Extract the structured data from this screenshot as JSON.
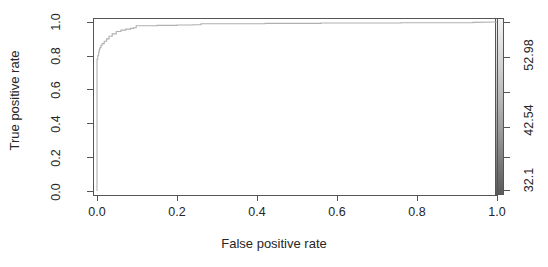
{
  "chart_data": {
    "type": "line",
    "title": "",
    "xlabel": "False positive rate",
    "ylabel": "True positive rate",
    "xlim": [
      0.0,
      1.0
    ],
    "ylim": [
      0.0,
      1.0
    ],
    "grid": false,
    "legend": "none",
    "xticks": [
      "0.0",
      "0.2",
      "0.4",
      "0.6",
      "0.8",
      "1.0"
    ],
    "xtick_values": [
      0.0,
      0.2,
      0.4,
      0.6,
      0.8,
      1.0
    ],
    "yticks": [
      "0.0",
      "0.2",
      "0.4",
      "0.6",
      "0.8",
      "1.0"
    ],
    "ytick_values": [
      0.0,
      0.2,
      0.4,
      0.6,
      0.8,
      1.0
    ],
    "series": [
      {
        "name": "ROC curve",
        "color": "#b0b0b0",
        "x": [
          0.0,
          0.0,
          0.002,
          0.002,
          0.004,
          0.004,
          0.005,
          0.005,
          0.006,
          0.006,
          0.008,
          0.008,
          0.01,
          0.01,
          0.013,
          0.013,
          0.018,
          0.018,
          0.024,
          0.024,
          0.03,
          0.03,
          0.038,
          0.038,
          0.048,
          0.048,
          0.06,
          0.06,
          0.072,
          0.072,
          0.084,
          0.084,
          0.092,
          0.092,
          0.098,
          0.098,
          0.15,
          0.15,
          0.2,
          0.2,
          0.24,
          0.24,
          0.26,
          0.26,
          0.42,
          0.42,
          0.56,
          0.56,
          0.76,
          0.76,
          0.94,
          0.94,
          1.0
        ],
        "y": [
          0.0,
          0.78,
          0.78,
          0.8,
          0.8,
          0.818,
          0.818,
          0.83,
          0.83,
          0.84,
          0.84,
          0.85,
          0.85,
          0.862,
          0.862,
          0.872,
          0.872,
          0.886,
          0.886,
          0.9,
          0.9,
          0.916,
          0.916,
          0.93,
          0.93,
          0.944,
          0.944,
          0.952,
          0.952,
          0.958,
          0.958,
          0.962,
          0.962,
          0.966,
          0.966,
          0.978,
          0.978,
          0.98,
          0.98,
          0.982,
          0.982,
          0.984,
          0.984,
          0.99,
          0.99,
          0.992,
          0.992,
          0.994,
          0.994,
          0.996,
          0.996,
          0.998,
          1.0
        ]
      }
    ],
    "colorbar": {
      "orientation": "vertical",
      "labels": [
        "52.98",
        "42.54",
        "32.1"
      ],
      "label_values": [
        52.98,
        42.54,
        32.1
      ],
      "tick_count": 6,
      "gradient_top_color": "#f2f2f2",
      "gradient_bottom_color": "#5a5a5a"
    }
  },
  "axes": {
    "x_title": "False positive rate",
    "y_title": "True positive rate"
  }
}
